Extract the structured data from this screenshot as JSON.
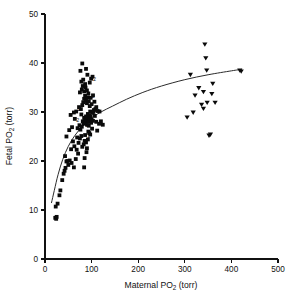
{
  "chart_data": {
    "type": "scatter",
    "title": "",
    "xlabel": "Maternal PO2 (torr)",
    "xlabel_main": "Maternal PO",
    "xlabel_sub": "2",
    "xlabel_unit": " (torr)",
    "ylabel": "Fetal PO2 (torr)",
    "ylabel_main": "Fetal PO",
    "ylabel_sub": "2",
    "ylabel_unit": " (torr)",
    "xlim": [
      0,
      500
    ],
    "ylim": [
      0,
      50
    ],
    "xticks": [
      0,
      100,
      200,
      300,
      400,
      500
    ],
    "yticks": [
      0,
      10,
      20,
      30,
      40,
      50
    ],
    "xtick_labels": [
      "0",
      "100",
      "200",
      "300",
      "400",
      "500"
    ],
    "ytick_labels": [
      "0",
      "10",
      "20",
      "30",
      "40",
      "50"
    ],
    "grid": false,
    "legend": "none",
    "marker_colors": {
      "square": "#0a0a0a",
      "triangle": "#0a0a0a",
      "curve": "#2b2b2b",
      "axis": "#111111"
    },
    "series": [
      {
        "name": "air-breathing",
        "marker": "square",
        "points": [
          [
            22,
            8.4
          ],
          [
            24,
            8.2
          ],
          [
            25,
            8.6
          ],
          [
            23,
            10.7
          ],
          [
            27,
            11.3
          ],
          [
            31,
            13.0
          ],
          [
            33,
            14.0
          ],
          [
            37,
            16.1
          ],
          [
            40,
            17.4
          ],
          [
            42,
            18.0
          ],
          [
            44,
            18.6
          ],
          [
            46,
            19.9
          ],
          [
            48,
            20.0
          ],
          [
            50,
            19.2
          ],
          [
            53,
            20.1
          ],
          [
            57,
            19.6
          ],
          [
            62,
            18.7
          ],
          [
            66,
            20.4
          ],
          [
            43,
            21.0
          ],
          [
            56,
            22.4
          ],
          [
            60,
            24.0
          ],
          [
            63,
            23.0
          ],
          [
            68,
            22.3
          ],
          [
            72,
            23.7
          ],
          [
            75,
            24.6
          ],
          [
            78,
            25.1
          ],
          [
            80,
            22.9
          ],
          [
            83,
            23.4
          ],
          [
            85,
            24.1
          ],
          [
            86,
            25.3
          ],
          [
            88,
            23.8
          ],
          [
            90,
            22.6
          ],
          [
            92,
            24.4
          ],
          [
            95,
            25.7
          ],
          [
            70,
            26.7
          ],
          [
            74,
            27.3
          ],
          [
            76,
            26.4
          ],
          [
            79,
            27.0
          ],
          [
            81,
            28.1
          ],
          [
            83,
            27.6
          ],
          [
            84,
            28.8
          ],
          [
            86,
            28.3
          ],
          [
            87,
            27.9
          ],
          [
            88,
            29.1
          ],
          [
            89,
            28.5
          ],
          [
            90,
            27.4
          ],
          [
            91,
            28.9
          ],
          [
            92,
            29.6
          ],
          [
            93,
            28.0
          ],
          [
            94,
            27.2
          ],
          [
            95,
            29.3
          ],
          [
            96,
            28.6
          ],
          [
            97,
            30.1
          ],
          [
            98,
            29.0
          ],
          [
            99,
            27.8
          ],
          [
            100,
            28.4
          ],
          [
            101,
            29.8
          ],
          [
            103,
            28.2
          ],
          [
            105,
            30.4
          ],
          [
            107,
            29.2
          ],
          [
            110,
            28.0
          ],
          [
            112,
            26.2
          ],
          [
            116,
            27.6
          ],
          [
            120,
            28.1
          ],
          [
            124,
            27.4
          ],
          [
            58,
            26.9
          ],
          [
            64,
            28.6
          ],
          [
            52,
            26.3
          ],
          [
            46,
            25.0
          ],
          [
            67,
            30.1
          ],
          [
            73,
            31.0
          ],
          [
            77,
            30.6
          ],
          [
            80,
            31.4
          ],
          [
            82,
            32.0
          ],
          [
            84,
            32.7
          ],
          [
            86,
            33.3
          ],
          [
            88,
            32.4
          ],
          [
            90,
            31.8
          ],
          [
            92,
            33.0
          ],
          [
            94,
            32.2
          ],
          [
            96,
            31.2
          ],
          [
            98,
            32.9
          ],
          [
            100,
            31.6
          ],
          [
            103,
            33.4
          ],
          [
            106,
            32.1
          ],
          [
            110,
            31.0
          ],
          [
            113,
            30.2
          ],
          [
            75,
            34.0
          ],
          [
            79,
            34.6
          ],
          [
            81,
            35.3
          ],
          [
            84,
            34.2
          ],
          [
            87,
            35.0
          ],
          [
            90,
            34.4
          ],
          [
            93,
            33.8
          ],
          [
            78,
            36.2
          ],
          [
            82,
            36.6
          ],
          [
            86,
            35.7
          ],
          [
            96,
            36.0
          ],
          [
            99,
            36.8
          ],
          [
            102,
            37.2
          ],
          [
            76,
            38.4
          ],
          [
            80,
            39.9
          ],
          [
            88,
            38.8
          ],
          [
            91,
            37.6
          ],
          [
            104,
            30.0
          ],
          [
            108,
            30.6
          ],
          [
            117,
            30.1
          ],
          [
            62,
            29.9
          ],
          [
            55,
            29.4
          ],
          [
            69,
            24.8
          ],
          [
            71,
            21.5
          ],
          [
            84,
            18.7
          ],
          [
            78,
            29.5
          ],
          [
            93,
            26.0
          ],
          [
            101,
            26.6
          ],
          [
            97,
            25.4
          ],
          [
            89,
            21.8
          ],
          [
            85,
            20.6
          ]
        ]
      },
      {
        "name": "oxygen-breathing",
        "marker": "triangle",
        "points": [
          [
            305,
            29.0
          ],
          [
            312,
            37.7
          ],
          [
            318,
            30.0
          ],
          [
            322,
            33.5
          ],
          [
            330,
            35.0
          ],
          [
            336,
            31.6
          ],
          [
            340,
            34.2
          ],
          [
            343,
            43.9
          ],
          [
            345,
            41.1
          ],
          [
            347,
            38.6
          ],
          [
            340,
            30.8
          ],
          [
            348,
            32.0
          ],
          [
            352,
            25.3
          ],
          [
            355,
            25.5
          ],
          [
            358,
            33.8
          ],
          [
            360,
            35.9
          ],
          [
            365,
            32.0
          ],
          [
            418,
            38.6
          ],
          [
            421,
            38.4
          ]
        ]
      }
    ],
    "duplicate_markers": [
      {
        "x": 103,
        "y": 36.3,
        "label": "2"
      },
      {
        "x": 100,
        "y": 32.8,
        "label": "2"
      },
      {
        "x": 108,
        "y": 30.1,
        "label": "2"
      },
      {
        "x": 70,
        "y": 30.2,
        "label": "2"
      },
      {
        "x": 67,
        "y": 28.0,
        "label": "2"
      },
      {
        "x": 88,
        "y": 26.9,
        "label": "2"
      },
      {
        "x": 91,
        "y": 24.6,
        "label": "2"
      }
    ],
    "fit_curve": {
      "description": "saturating regression curve",
      "points": [
        [
          14,
          11.5
        ],
        [
          20,
          14.0
        ],
        [
          28,
          17.2
        ],
        [
          38,
          20.3
        ],
        [
          50,
          23.0
        ],
        [
          64,
          25.2
        ],
        [
          80,
          27.0
        ],
        [
          100,
          28.8
        ],
        [
          120,
          30.0
        ],
        [
          145,
          31.2
        ],
        [
          175,
          32.6
        ],
        [
          210,
          34.0
        ],
        [
          250,
          35.3
        ],
        [
          300,
          36.6
        ],
        [
          350,
          37.6
        ],
        [
          400,
          38.4
        ],
        [
          422,
          38.7
        ]
      ]
    }
  },
  "plot_geometry": {
    "left_px": 45,
    "right_px": 278,
    "top_px": 14,
    "bottom_px": 259
  }
}
